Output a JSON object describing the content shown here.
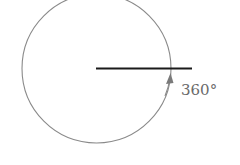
{
  "diagram": {
    "type": "angle-rotation",
    "angle_label": "360°",
    "colors": {
      "circle": "#8a8a8a",
      "ray": "#1a1a1a",
      "arrow": "#7a7a7a",
      "label": "#6a6a6a",
      "background": "#ffffff"
    }
  }
}
